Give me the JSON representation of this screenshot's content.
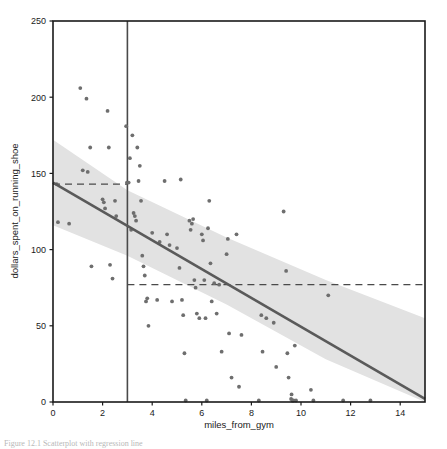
{
  "figure": {
    "caption": "Figure 12.1   Scatterplot with regression line",
    "background_color": "#ffffff"
  },
  "chart_data": {
    "type": "scatter",
    "title": "",
    "subtitle": "",
    "xlabel": "miles_from_gym",
    "ylabel": "dollars_spent_on_running_shoe",
    "xlim": [
      0,
      15
    ],
    "ylim": [
      0,
      250
    ],
    "xticks": [
      0,
      2,
      4,
      6,
      8,
      10,
      12,
      14
    ],
    "xticklabels": [
      "0",
      "2",
      "4",
      "6",
      "8",
      "10",
      "12",
      "14"
    ],
    "yticks": [
      0,
      50,
      100,
      150,
      200,
      250
    ],
    "yticklabels": [
      "0",
      "50",
      "100",
      "150",
      "200",
      "250"
    ],
    "grid": false,
    "legend": null,
    "legend_position": "none",
    "point_color": "#6e6e6e",
    "line_color": "#5a5a5a",
    "band_color": "#e2e2e2",
    "annotation_color": "#4a4a4a",
    "series": [
      {
        "name": "observations",
        "type": "scatter",
        "marker": "circle",
        "points": [
          [
            0.15,
            143
          ],
          [
            0.2,
            118
          ],
          [
            0.65,
            117
          ],
          [
            1.1,
            206
          ],
          [
            1.2,
            152
          ],
          [
            1.35,
            199
          ],
          [
            1.4,
            151
          ],
          [
            1.5,
            167
          ],
          [
            1.55,
            89
          ],
          [
            2.0,
            133
          ],
          [
            2.05,
            131
          ],
          [
            2.1,
            127
          ],
          [
            2.2,
            191
          ],
          [
            2.25,
            167
          ],
          [
            2.3,
            90
          ],
          [
            2.4,
            81
          ],
          [
            2.5,
            132
          ],
          [
            2.55,
            122
          ],
          [
            2.95,
            181
          ],
          [
            2.98,
            144
          ],
          [
            3.05,
            144
          ],
          [
            3.1,
            160
          ],
          [
            3.15,
            113
          ],
          [
            3.2,
            175
          ],
          [
            3.25,
            124
          ],
          [
            3.3,
            122
          ],
          [
            3.35,
            119
          ],
          [
            3.4,
            167
          ],
          [
            3.45,
            145
          ],
          [
            3.5,
            155
          ],
          [
            3.55,
            132
          ],
          [
            3.6,
            96
          ],
          [
            3.65,
            89
          ],
          [
            3.7,
            83
          ],
          [
            3.75,
            66
          ],
          [
            3.8,
            68
          ],
          [
            3.85,
            50
          ],
          [
            4.0,
            111
          ],
          [
            4.2,
            67
          ],
          [
            4.3,
            105
          ],
          [
            4.5,
            145
          ],
          [
            4.6,
            110
          ],
          [
            4.7,
            103
          ],
          [
            4.8,
            66
          ],
          [
            5.0,
            101
          ],
          [
            5.1,
            88
          ],
          [
            5.15,
            146
          ],
          [
            5.2,
            67
          ],
          [
            5.25,
            57
          ],
          [
            5.3,
            32
          ],
          [
            5.35,
            1
          ],
          [
            5.5,
            119
          ],
          [
            5.55,
            113
          ],
          [
            5.6,
            117
          ],
          [
            5.65,
            120
          ],
          [
            5.7,
            80
          ],
          [
            5.75,
            75
          ],
          [
            5.8,
            58
          ],
          [
            5.9,
            55
          ],
          [
            6.0,
            110
          ],
          [
            6.05,
            106
          ],
          [
            6.1,
            80
          ],
          [
            6.15,
            55
          ],
          [
            6.2,
            1
          ],
          [
            6.25,
            114
          ],
          [
            6.3,
            132
          ],
          [
            6.35,
            91
          ],
          [
            6.4,
            66
          ],
          [
            6.5,
            78
          ],
          [
            6.6,
            58
          ],
          [
            6.7,
            77
          ],
          [
            6.8,
            33
          ],
          [
            7.0,
            97
          ],
          [
            7.05,
            107
          ],
          [
            7.1,
            45
          ],
          [
            7.2,
            16
          ],
          [
            7.4,
            110
          ],
          [
            7.5,
            10
          ],
          [
            7.6,
            44
          ],
          [
            8.3,
            1
          ],
          [
            8.4,
            57
          ],
          [
            8.45,
            33
          ],
          [
            8.6,
            55
          ],
          [
            8.9,
            52
          ],
          [
            9.0,
            23
          ],
          [
            9.3,
            125
          ],
          [
            9.4,
            86
          ],
          [
            9.45,
            32
          ],
          [
            9.5,
            16
          ],
          [
            9.6,
            2
          ],
          [
            9.62,
            5
          ],
          [
            9.65,
            1
          ],
          [
            9.7,
            1
          ],
          [
            9.75,
            37
          ],
          [
            9.8,
            1
          ],
          [
            10.4,
            8
          ],
          [
            10.5,
            1
          ],
          [
            11.1,
            70
          ],
          [
            11.7,
            1
          ],
          [
            12.8,
            1
          ]
        ]
      }
    ],
    "regression_line": {
      "name": "fitted regression line",
      "type": "line",
      "x": [
        0,
        15
      ],
      "y": [
        144,
        2
      ],
      "color": "#5a5a5a",
      "width": 2.6
    },
    "confidence_band": {
      "name": "confidence interval band",
      "x": [
        0,
        3,
        7,
        11,
        15
      ],
      "upper": [
        172,
        139,
        108,
        80,
        55
      ],
      "lower": [
        116,
        96,
        64,
        28,
        0
      ],
      "color": "#e2e2e2"
    },
    "annotations": [
      {
        "name": "vertical-reference-line",
        "type": "vline",
        "x": 3,
        "y_from": 0,
        "y_to": 250,
        "style": "solid",
        "color": "#4a4a4a"
      },
      {
        "name": "upper-horizontal-dashed-line",
        "type": "hline",
        "y": 143,
        "x_from": 0,
        "x_to": 3,
        "style": "dashed",
        "color": "#4a4a4a"
      },
      {
        "name": "lower-horizontal-dashed-line",
        "type": "hline",
        "y": 77,
        "x_from": 3,
        "x_to": 15,
        "style": "dashed",
        "color": "#4a4a4a"
      }
    ]
  }
}
